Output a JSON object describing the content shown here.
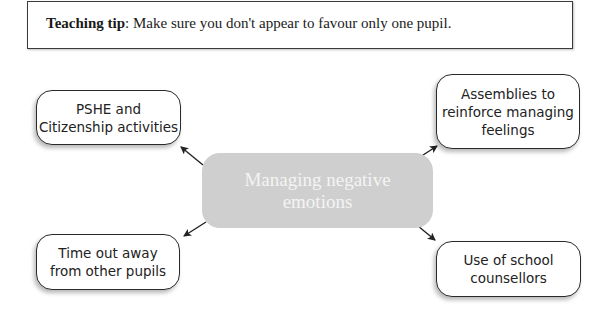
{
  "teaching_tip": {
    "label": "Teaching tip",
    "separator": ": ",
    "text": "Make sure you don't appear to favour only one pupil."
  },
  "diagram": {
    "center": {
      "label": "Managing negative\nemotions",
      "fill": "#cfcfcf"
    },
    "nodes": [
      {
        "id": "pshe",
        "label": "PSHE and\nCitizenship activities",
        "position": "top-left"
      },
      {
        "id": "assemblies",
        "label": "Assemblies to\nreinforce managing\nfeelings",
        "position": "top-right"
      },
      {
        "id": "timeout",
        "label": "Time out away\nfrom other pupils",
        "position": "bottom-left"
      },
      {
        "id": "counsellors",
        "label": "Use of school\ncounsellors",
        "position": "bottom-right"
      }
    ]
  }
}
